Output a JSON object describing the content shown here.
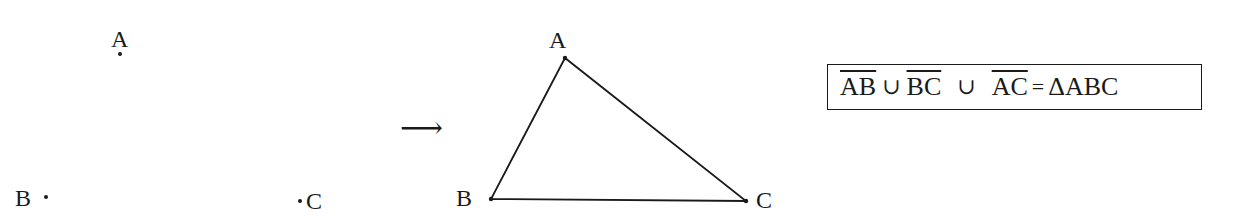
{
  "left_figure": {
    "points": [
      {
        "label": "A",
        "x": 120,
        "y": 54
      },
      {
        "label": "B",
        "x": 56,
        "y": 199
      },
      {
        "label": "C",
        "x": 300,
        "y": 201
      }
    ]
  },
  "arrow": {
    "symbol": "⟶"
  },
  "right_figure": {
    "vertices": [
      {
        "label": "A",
        "x": 565,
        "y": 58
      },
      {
        "label": "B",
        "x": 491,
        "y": 199
      },
      {
        "label": "C",
        "x": 746,
        "y": 201
      }
    ],
    "stroke_color": "#1a1a1a"
  },
  "formula": {
    "seg1": "AB",
    "op1": "∪",
    "seg2": "BC",
    "op2": "∪",
    "seg3": "AC",
    "eq": "=",
    "result": "ΔABC"
  }
}
